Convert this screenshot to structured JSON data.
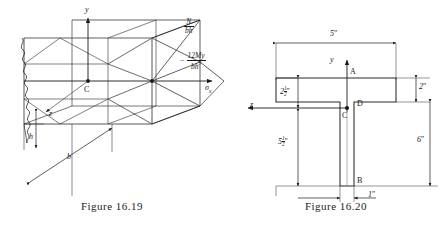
{
  "figure_left": {
    "caption_prefix": "Figure",
    "caption_number": "16.19",
    "caption_full": "Figure 16.19",
    "axis_y": "y",
    "axis_z": "z",
    "axis_sigma": "σ",
    "axis_sigma_sub": "x",
    "centroid_label": "C",
    "dim_h": "h",
    "dim_b": "b",
    "stress_axial_num": "N",
    "stress_axial_den": "bh",
    "stress_bending_sign": "−",
    "stress_bending_num": "12My",
    "stress_bending_den": "bh",
    "stress_bending_den_exp": "3"
  },
  "figure_right": {
    "caption_prefix": "Figure",
    "caption_number": "16.20",
    "caption_full": "Figure 16.20",
    "axis_y": "y",
    "axis_z": "z",
    "axis_sigma": "σ",
    "axis_sigma_sub": "x",
    "point_a": "A",
    "point_b": "B",
    "point_c": "C",
    "point_d": "D",
    "dim_flange_width": "5",
    "dim_flange_width_unit": "″",
    "dim_flange_thickness": "2",
    "dim_flange_thickness_unit": "″",
    "dim_total_depth": "6",
    "dim_total_depth_unit": "″",
    "dim_web_width": "1",
    "dim_web_width_unit": "″",
    "dim_above_centroid_whole": "2",
    "dim_above_centroid_num": "1",
    "dim_above_centroid_den": "2",
    "dim_above_centroid_unit": "″",
    "dim_below_centroid_whole": "5",
    "dim_below_centroid_num": "1",
    "dim_below_centroid_den": "2",
    "dim_below_centroid_unit": "″"
  },
  "colors": {
    "ink": "#1a1a1a",
    "line": "#2b2b2b",
    "background": "#ffffff"
  }
}
